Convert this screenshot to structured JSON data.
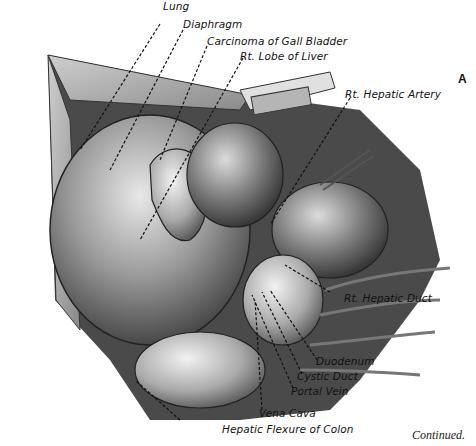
{
  "figure": {
    "panel_letter": "A",
    "continued_note": "Continued.",
    "labels": [
      {
        "id": "lung",
        "text": "Lung"
      },
      {
        "id": "diaphragm",
        "text": "Diaphragm"
      },
      {
        "id": "carcinoma",
        "text": "Carcinoma of Gall Bladder"
      },
      {
        "id": "rt_lobe_liver",
        "text": "Rt. Lobe of Liver"
      },
      {
        "id": "rt_hepatic_artery",
        "text": "Rt. Hepatic Artery"
      },
      {
        "id": "rt_hepatic_duct",
        "text": "Rt. Hepatic Duct"
      },
      {
        "id": "duodenum",
        "text": "Duodenum"
      },
      {
        "id": "cystic_duct",
        "text": "Cystic Duct"
      },
      {
        "id": "portal_vein",
        "text": "Portal Vein"
      },
      {
        "id": "vena_cava",
        "text": "Vena Cava"
      },
      {
        "id": "hepatic_flexure",
        "text": "Hepatic Flexure of Colon"
      }
    ]
  }
}
